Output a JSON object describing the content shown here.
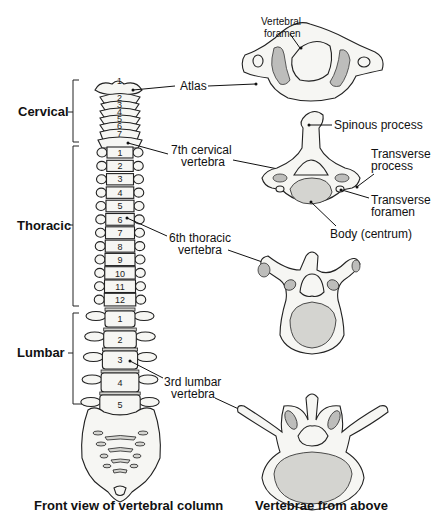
{
  "regions": {
    "cervical": "Cervical",
    "thoracic": "Thoracic",
    "lumbar": "Lumbar"
  },
  "labels": {
    "atlas": "Atlas",
    "vertebral_foramen": [
      "Vertebral",
      "foramen"
    ],
    "cervical7": [
      "7th cervical",
      "vertebra"
    ],
    "spinous_process": "Spinous process",
    "transverse_process": [
      "Transverse",
      "process"
    ],
    "transverse_foramen": [
      "Transverse",
      "foramen"
    ],
    "body": "Body (centrum)",
    "thoracic6": [
      "6th thoracic",
      "vertebra"
    ],
    "lumbar3": [
      "3rd lumbar",
      "vertebra"
    ]
  },
  "vertebra_numbers": {
    "cervical": [
      "1",
      "2",
      "3",
      "4",
      "5",
      "6",
      "7"
    ],
    "thoracic": [
      "1",
      "2",
      "3",
      "4",
      "5",
      "6",
      "7",
      "8",
      "9",
      "10",
      "11",
      "12"
    ],
    "lumbar": [
      "1",
      "2",
      "3",
      "4",
      "5"
    ]
  },
  "captions": {
    "left": "Front view of vertebral column",
    "right": "Vertebrae from above"
  }
}
